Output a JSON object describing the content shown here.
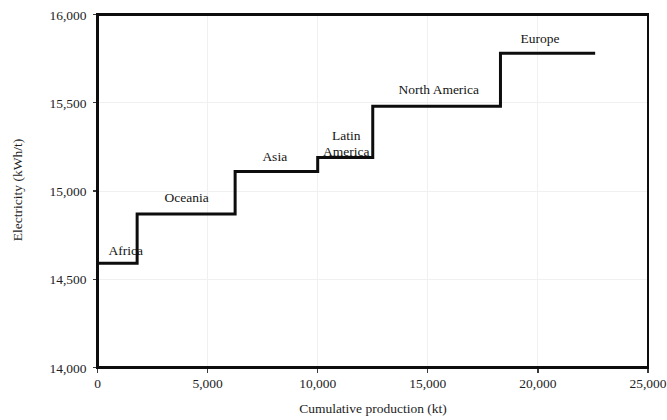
{
  "chart_data": {
    "type": "area",
    "subtype": "step-chart",
    "title": "",
    "xlabel": "Cumulative production (kt)",
    "ylabel": "Electricity (kWh/t)",
    "xlim": [
      0,
      25000
    ],
    "ylim": [
      14000,
      16000
    ],
    "x_ticks": [
      0,
      5000,
      10000,
      15000,
      20000,
      25000
    ],
    "x_tick_labels": [
      "0",
      "5,000",
      "10,000",
      "15,000",
      "20,000",
      "25,000"
    ],
    "y_ticks": [
      14000,
      14500,
      15000,
      15500,
      16000
    ],
    "y_tick_labels": [
      "14,000",
      "14,500",
      "15,000",
      "15,500",
      "16,000"
    ],
    "grid": true,
    "grid_color": "#f0f0f0",
    "line_color": "#0d0d0d",
    "line_width": 3,
    "legend": "none",
    "annotations": [
      {
        "label": "Africa",
        "x": 500,
        "y": 14640,
        "anchor": "start"
      },
      {
        "label": "Oceania",
        "x": 4050,
        "y": 14940,
        "anchor": "middle"
      },
      {
        "label": "Asia",
        "x": 8050,
        "y": 15170,
        "anchor": "middle"
      },
      {
        "label": "Latin America",
        "x": 11300,
        "y": 15290,
        "anchor": "middle",
        "lines": [
          "Latin",
          "America"
        ]
      },
      {
        "label": "North America",
        "x": 15500,
        "y": 15550,
        "anchor": "middle"
      },
      {
        "label": "Europe",
        "x": 20100,
        "y": 15840,
        "anchor": "middle"
      }
    ],
    "steps": [
      {
        "name": "Africa",
        "x_start": 0,
        "x_end": 1800,
        "value": 14590
      },
      {
        "name": "Oceania",
        "x_start": 1800,
        "x_end": 6250,
        "value": 14870
      },
      {
        "name": "Asia",
        "x_start": 6250,
        "x_end": 10000,
        "value": 15110
      },
      {
        "name": "Latin America",
        "x_start": 10000,
        "x_end": 12500,
        "value": 15190
      },
      {
        "name": "North America",
        "x_start": 12500,
        "x_end": 18300,
        "value": 15480
      },
      {
        "name": "Europe",
        "x_start": 18300,
        "x_end": 22600,
        "value": 15780
      }
    ]
  }
}
